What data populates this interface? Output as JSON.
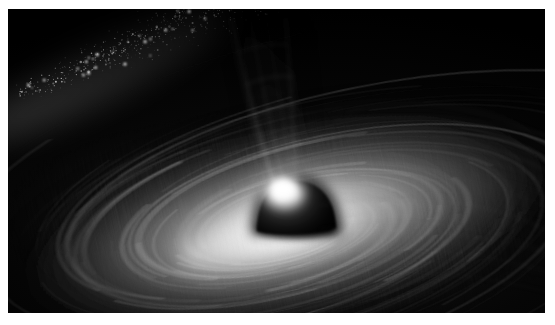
{
  "image": {
    "title": "Supermassive Black Hole with Accretion Disk and Relativistic Jet",
    "alt_text": "Artist rendering of a black hole: a dark dome-shaped shadow at center surrounded by a bright, tilted, swirling grayscale accretion disk, with a luminous cone-shaped jet rising from behind the black hole toward the upper left, and a speckled band of stars streaming across the upper-left corner of the black sky.",
    "palette": "monochrome-grayscale",
    "width_px": 555,
    "height_px": 325,
    "border_color": "#ffffff",
    "background_color": "#000000",
    "caption": ""
  },
  "frame": {
    "mat_top_px": 9,
    "mat_left_px": 8,
    "mat_right_px": 10,
    "mat_bottom_px": 12
  },
  "features": {
    "black_hole": {
      "label": "black-hole-shadow",
      "center_x": 292,
      "center_y": 213,
      "radius_x": 36,
      "radius_y": 30,
      "color": "#000000"
    },
    "accretion_disk": {
      "label": "accretion-disk",
      "center_x": 282,
      "center_y": 218,
      "outer_radius_x": 320,
      "outer_radius_y": 120,
      "tilt_deg": -12,
      "inner_bright_color": "#ffffff",
      "mid_color": "#9a9a9a",
      "outer_color": "#1a1a1a",
      "filament_count": 34
    },
    "jet": {
      "label": "relativistic-jet",
      "base_x": 276,
      "base_y": 182,
      "tip_x": 218,
      "tip_y": 2,
      "base_width": 34,
      "tip_width": 96,
      "brightest_color": "#ffffff",
      "edge_color": "#6e6e6e"
    },
    "star_band": {
      "label": "star-dust-band",
      "angle_deg": 28,
      "origin_x": 14,
      "origin_y": 96,
      "end_x": 200,
      "end_y": 14,
      "star_count": 560,
      "color": "#ffffff"
    },
    "photon_glow": {
      "label": "photon-ring-glow",
      "center_x": 278,
      "center_y": 214,
      "color": "#ffffff"
    }
  }
}
